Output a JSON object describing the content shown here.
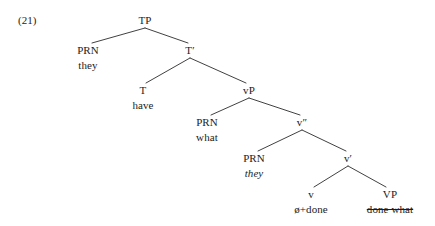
{
  "figure": {
    "example_number": "(21)",
    "kind": "syntax-tree",
    "sentence_reading": "they have what done",
    "line_color": "#2b2b2b",
    "text_color": "#1c1c1c",
    "background_color": "#ffffff"
  },
  "nodes": {
    "tp": {
      "label": "TP",
      "x": 145,
      "y": 14
    },
    "prn_they": {
      "label": "PRN",
      "lex": "they",
      "x": 88,
      "y": 44
    },
    "tbar": {
      "label": "T′",
      "x": 190,
      "y": 44
    },
    "t_have": {
      "label": "T",
      "lex": "have",
      "x": 143,
      "y": 84
    },
    "vp": {
      "label": "vP",
      "x": 249,
      "y": 84
    },
    "prn_what": {
      "label": "PRN",
      "lex": "what",
      "x": 207,
      "y": 116
    },
    "vbb": {
      "label": "v″",
      "x": 302,
      "y": 116
    },
    "prn_they2": {
      "label": "PRN",
      "lex": "they",
      "x": 254,
      "y": 152
    },
    "vbar": {
      "label": "v′",
      "x": 348,
      "y": 152
    },
    "v_done": {
      "label": "v",
      "lex": "ø+done",
      "x": 311,
      "y": 188
    },
    "vp_done": {
      "label": "VP",
      "lex": "done what",
      "x": 390,
      "y": 188
    }
  },
  "edges": [
    {
      "from": "tp",
      "to": "prn_they",
      "x1": 145,
      "y1": 28,
      "x2": 92,
      "y2": 43
    },
    {
      "from": "tp",
      "to": "tbar",
      "x1": 145,
      "y1": 28,
      "x2": 188,
      "y2": 43
    },
    {
      "from": "tbar",
      "to": "t_have",
      "x1": 190,
      "y1": 58,
      "x2": 146,
      "y2": 83
    },
    {
      "from": "tbar",
      "to": "vp",
      "x1": 190,
      "y1": 58,
      "x2": 246,
      "y2": 83
    },
    {
      "from": "vp",
      "to": "prn_what",
      "x1": 249,
      "y1": 98,
      "x2": 211,
      "y2": 115
    },
    {
      "from": "vp",
      "to": "vbb",
      "x1": 249,
      "y1": 98,
      "x2": 300,
      "y2": 115
    },
    {
      "from": "vbb",
      "to": "prn_they2",
      "x1": 302,
      "y1": 130,
      "x2": 258,
      "y2": 151
    },
    {
      "from": "vbb",
      "to": "vbar",
      "x1": 302,
      "y1": 130,
      "x2": 346,
      "y2": 151
    },
    {
      "from": "vbar",
      "to": "v_done",
      "x1": 348,
      "y1": 166,
      "x2": 314,
      "y2": 187
    },
    {
      "from": "vbar",
      "to": "vp_done",
      "x1": 348,
      "y1": 166,
      "x2": 386,
      "y2": 187
    }
  ],
  "labels": {
    "tp": "TP",
    "tbar": "T′",
    "vp": "vP",
    "vbb": "v″",
    "vbar": "v′",
    "prn": "PRN",
    "t": "T",
    "v": "v",
    "vp_leaf": "VP"
  }
}
